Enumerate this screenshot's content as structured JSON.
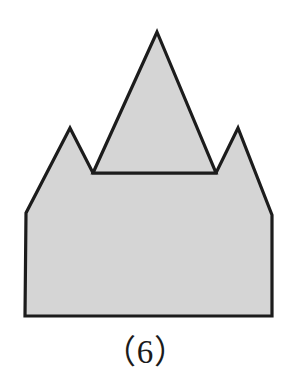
{
  "figure": {
    "caption": "（6）",
    "caption_plain": "(6)",
    "background_color": "#ffffff",
    "fill_color": "#d5d5d5",
    "stroke_color": "#1c1c1c",
    "stroke_width": 3.2,
    "canvas": {
      "width": 291,
      "height": 387
    },
    "shapes": [
      {
        "name": "notched-house-polygon",
        "kind": "polygon",
        "points": "25,316 26,213 70,128 93,173 216,173 238,128 272,215 272,316"
      },
      {
        "name": "overlapping-triangle",
        "kind": "polygon",
        "points": "157,32 216,173 93,173"
      }
    ],
    "vertices": [
      {
        "name": "triangle-apex",
        "x": 157,
        "y": 32
      },
      {
        "name": "left-peak",
        "x": 70,
        "y": 128
      },
      {
        "name": "right-peak",
        "x": 238,
        "y": 128
      },
      {
        "name": "notch-left-base",
        "x": 93,
        "y": 173
      },
      {
        "name": "notch-right-base",
        "x": 216,
        "y": 173
      },
      {
        "name": "left-shoulder",
        "x": 26,
        "y": 213
      },
      {
        "name": "right-shoulder",
        "x": 272,
        "y": 215
      },
      {
        "name": "bottom-left",
        "x": 25,
        "y": 316
      },
      {
        "name": "bottom-right",
        "x": 272,
        "y": 316
      }
    ]
  }
}
